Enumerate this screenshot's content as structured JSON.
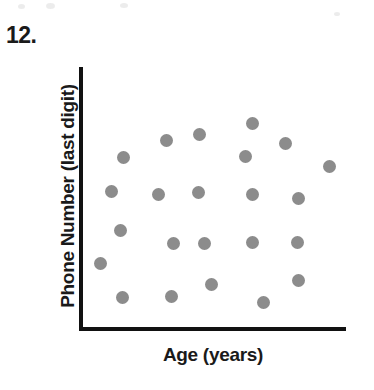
{
  "problem": {
    "number_label": "12."
  },
  "chart_data": {
    "type": "scatter",
    "title": "",
    "xlabel": "Age (years)",
    "ylabel": "Phone Number (last digit)",
    "grid": false,
    "legend": null,
    "axes": {
      "x_ticks": [],
      "y_ticks": [],
      "x_axis_line": true,
      "y_axis_line": true,
      "xlim": [
        0,
        10
      ],
      "ylim": [
        0,
        10
      ]
    },
    "marker": {
      "shape": "circle",
      "color": "#8c8c8c",
      "diameter_px": 13
    },
    "annotation": "No association: last digit of phone number is unrelated to age; points are scattered randomly.",
    "point_count": 23,
    "points_px": [
      {
        "x": 123,
        "y": 157
      },
      {
        "x": 166,
        "y": 140
      },
      {
        "x": 199,
        "y": 134
      },
      {
        "x": 252,
        "y": 123
      },
      {
        "x": 285,
        "y": 143
      },
      {
        "x": 245,
        "y": 156
      },
      {
        "x": 329,
        "y": 166
      },
      {
        "x": 111,
        "y": 191
      },
      {
        "x": 158,
        "y": 194
      },
      {
        "x": 198,
        "y": 192
      },
      {
        "x": 252,
        "y": 194
      },
      {
        "x": 298,
        "y": 198
      },
      {
        "x": 120,
        "y": 230
      },
      {
        "x": 173,
        "y": 243
      },
      {
        "x": 204,
        "y": 243
      },
      {
        "x": 252,
        "y": 242
      },
      {
        "x": 297,
        "y": 242
      },
      {
        "x": 100,
        "y": 263
      },
      {
        "x": 211,
        "y": 284
      },
      {
        "x": 298,
        "y": 280
      },
      {
        "x": 122,
        "y": 297
      },
      {
        "x": 171,
        "y": 296
      },
      {
        "x": 263,
        "y": 302
      }
    ],
    "speckles_px": [
      {
        "x": 18,
        "y": 4,
        "w": 7,
        "h": 5
      },
      {
        "x": 46,
        "y": 3,
        "w": 9,
        "h": 6
      },
      {
        "x": 120,
        "y": 3,
        "w": 8,
        "h": 5
      },
      {
        "x": 334,
        "y": 12,
        "w": 6,
        "h": 4
      }
    ]
  }
}
